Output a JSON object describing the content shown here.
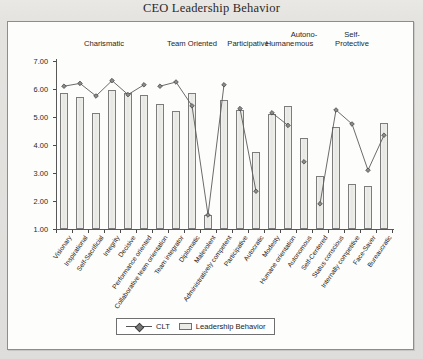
{
  "title": "CEO Leadership Behavior",
  "legend": {
    "series_line": "CLT",
    "series_bar": "Leadership Behavior"
  },
  "groups": [
    {
      "label": "Charismatic",
      "start": 0,
      "end": 5
    },
    {
      "label": "Team Oriented",
      "start": 6,
      "end": 10
    },
    {
      "label": "Participative",
      "start": 11,
      "end": 12
    },
    {
      "label": "Humane",
      "start": 13,
      "end": 14
    },
    {
      "label": "Autono-\nmous",
      "start": 15,
      "end": 15
    },
    {
      "label": "Self-\nProtective",
      "start": 16,
      "end": 20
    }
  ],
  "chart_data": {
    "type": "bar",
    "title": "CEO Leadership Behavior",
    "xlabel": "",
    "ylabel": "",
    "ylim": [
      1.0,
      7.0
    ],
    "ytick_labels": [
      "1.00",
      "2.00",
      "3.00",
      "4.00",
      "5.00",
      "6.00",
      "7.00"
    ],
    "ytick_values": [
      1.0,
      2.0,
      3.0,
      4.0,
      5.0,
      6.0,
      7.0
    ],
    "grid": false,
    "legend_position": "bottom",
    "categories": [
      "Visionary",
      "Inspirational",
      "Self-Sacrificial",
      "Integrity",
      "Decisive",
      "Performance oriented",
      "Collaborative team orientation",
      "Team integrator",
      "Diplomatic",
      "Malevolent",
      "Administratively competent",
      "Participative",
      "Autocratic",
      "Modesty",
      "Humane orientation",
      "Autonomous",
      "Self-Centered",
      "Status conscious",
      "Internally competitive",
      "Face-Saver",
      "Bureaucratic"
    ],
    "series": [
      {
        "name": "Leadership Behavior",
        "type": "bar",
        "values": [
          5.85,
          5.7,
          5.15,
          5.95,
          5.85,
          5.8,
          5.45,
          5.2,
          5.85,
          1.5,
          5.6,
          5.25,
          3.75,
          5.1,
          5.4,
          4.25,
          2.9,
          4.65,
          2.6,
          2.55,
          4.8
        ]
      },
      {
        "name": "CLT",
        "type": "line",
        "marker": "diamond",
        "values": [
          6.1,
          6.2,
          5.75,
          6.3,
          5.8,
          6.15,
          6.1,
          6.25,
          5.4,
          1.5,
          6.15,
          5.3,
          2.35,
          5.15,
          4.7,
          3.4,
          1.9,
          5.25,
          4.75,
          3.1,
          4.35
        ]
      }
    ],
    "segments": [
      [
        0,
        5
      ],
      [
        6,
        10
      ],
      [
        11,
        12
      ],
      [
        13,
        14
      ],
      [
        15,
        15
      ],
      [
        16,
        20
      ]
    ]
  }
}
